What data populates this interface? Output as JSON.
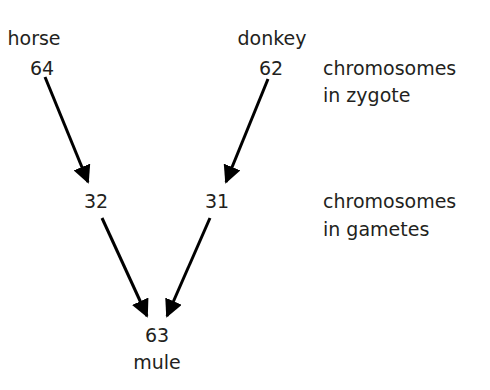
{
  "parents": {
    "horse": {
      "name": "horse",
      "zygote": "64",
      "gamete": "32"
    },
    "donkey": {
      "name": "donkey",
      "zygote": "62",
      "gamete": "31"
    }
  },
  "offspring": {
    "name": "mule",
    "count": "63"
  },
  "row_labels": {
    "zygote": [
      "chromosomes",
      "in zygote"
    ],
    "gametes": [
      "chromosomes",
      "in gametes"
    ]
  },
  "colors": {
    "text": "#231f20",
    "arrow": "#000000",
    "background": "#ffffff"
  }
}
